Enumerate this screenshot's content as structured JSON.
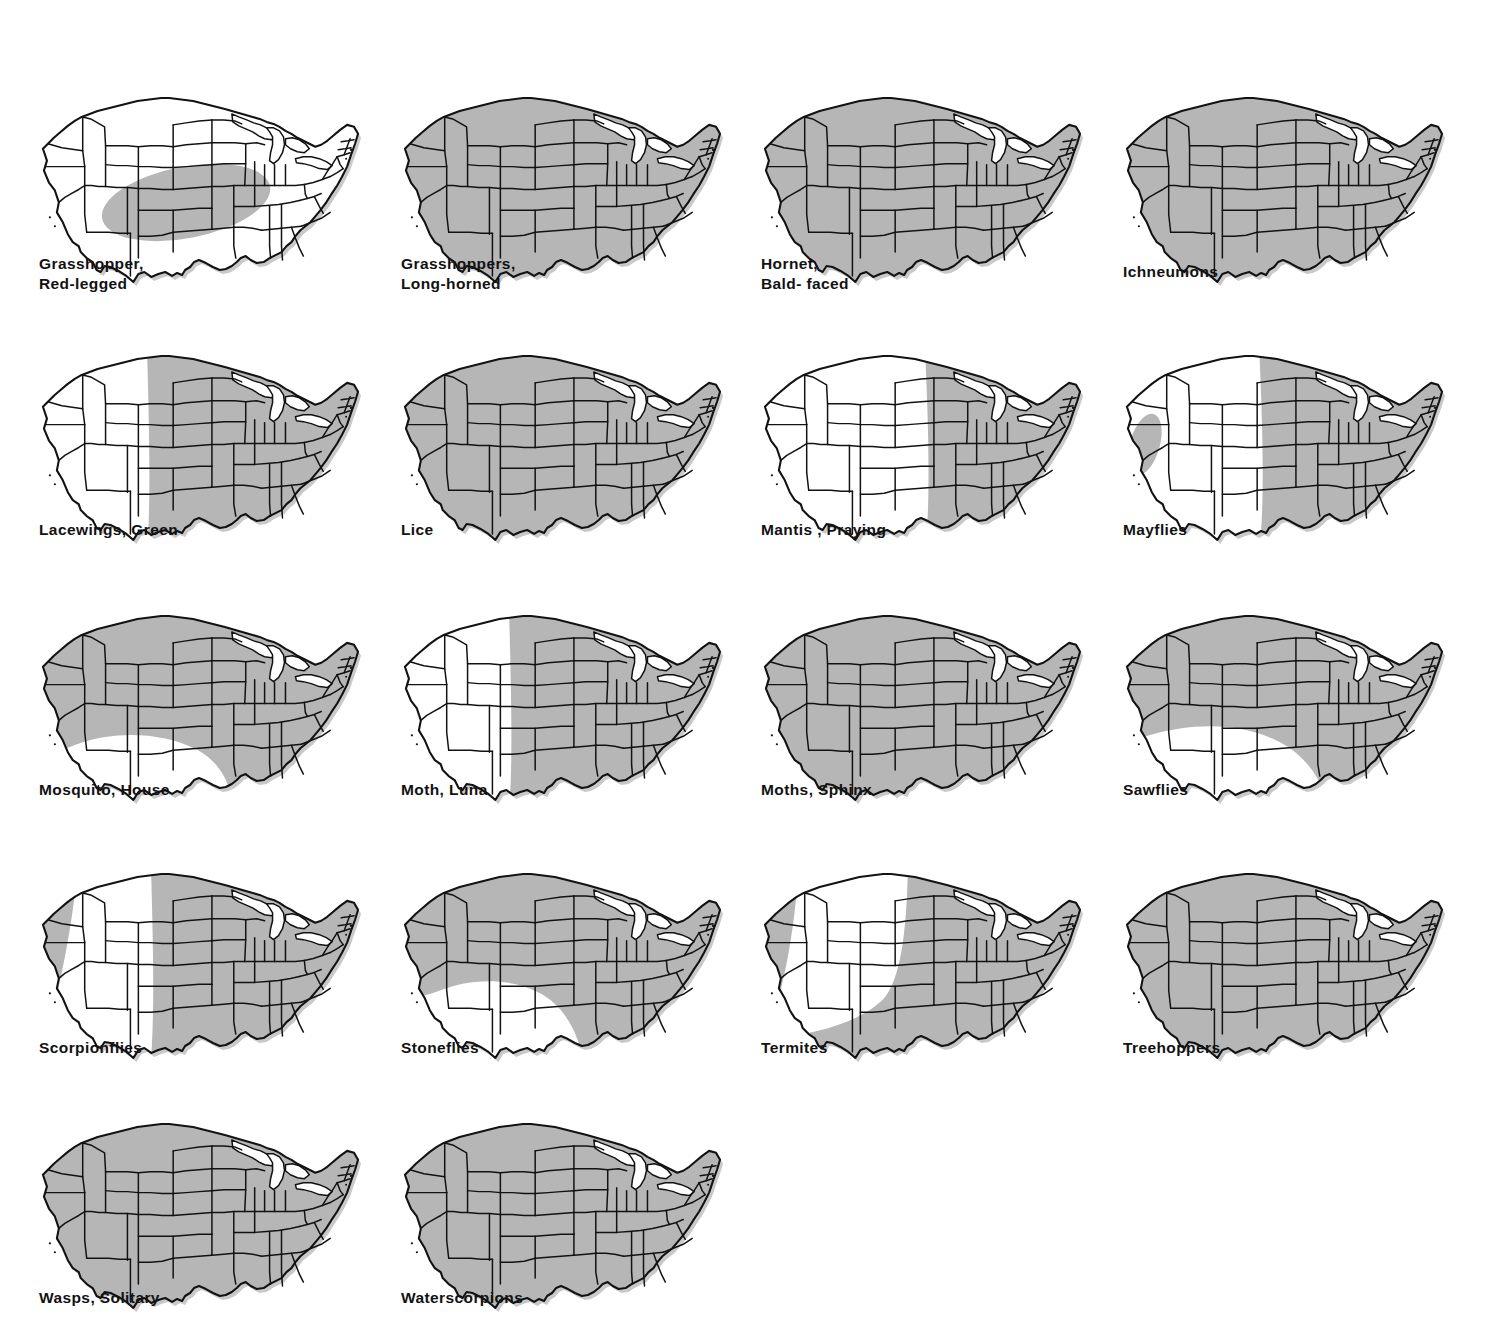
{
  "page": {
    "background_color": "#ffffff",
    "shade_color": "#b6b6b6",
    "ink_color": "#121212",
    "columns": 4,
    "rows": 5,
    "map_count": 18
  },
  "maps": [
    {
      "id": "grasshopper-red-legged",
      "label": "Grasshopper,\nRed-legged",
      "label_lines": [
        "Grasshopper,",
        "Red-legged"
      ],
      "range": "central-plains-blob",
      "row": 1,
      "col": 1
    },
    {
      "id": "grasshoppers-long-horned",
      "label": "Grasshoppers,\nLong-horned",
      "label_lines": [
        "Grasshoppers,",
        "Long-horned"
      ],
      "range": "entire",
      "row": 1,
      "col": 2
    },
    {
      "id": "hornet-bald-faced",
      "label": "Hornet,\nBald- faced",
      "label_lines": [
        "Hornet,",
        "Bald- faced"
      ],
      "range": "entire",
      "row": 1,
      "col": 3
    },
    {
      "id": "ichneumons",
      "label": "Ichneumons",
      "label_lines": [
        "Ichneumons"
      ],
      "range": "entire",
      "row": 1,
      "col": 4
    },
    {
      "id": "lacewings-green",
      "label": "Lacewings, Green",
      "label_lines": [
        "Lacewings, Green"
      ],
      "range": "east-of-rockies",
      "row": 2,
      "col": 1
    },
    {
      "id": "lice",
      "label": "Lice",
      "label_lines": [
        "Lice"
      ],
      "range": "entire",
      "row": 2,
      "col": 2
    },
    {
      "id": "mantis-praying",
      "label": "Mantis , Praying",
      "label_lines": [
        "Mantis , Praying"
      ],
      "range": "eastern-half",
      "row": 2,
      "col": 3
    },
    {
      "id": "mayflies",
      "label": "Mayflies",
      "label_lines": [
        "Mayflies"
      ],
      "range": "east-plus-california",
      "row": 2,
      "col": 4
    },
    {
      "id": "mosquito-house",
      "label": "Mosquito, House",
      "label_lines": [
        "Mosquito, House"
      ],
      "range": "all-but-southwest",
      "row": 3,
      "col": 1
    },
    {
      "id": "moth-luna",
      "label": "Moth, Luna",
      "label_lines": [
        "Moth, Luna"
      ],
      "range": "east-of-rockies",
      "row": 3,
      "col": 2
    },
    {
      "id": "moths-sphinx",
      "label": "Moths, Sphinx",
      "label_lines": [
        "Moths, Sphinx"
      ],
      "range": "entire",
      "row": 3,
      "col": 3
    },
    {
      "id": "sawflies",
      "label": "Sawflies",
      "label_lines": [
        "Sawflies"
      ],
      "range": "all-but-southwest-wide",
      "row": 3,
      "col": 4
    },
    {
      "id": "scorpionflies",
      "label": "Scorpionflies",
      "label_lines": [
        "Scorpionflies"
      ],
      "range": "east-plus-pacific-coast",
      "row": 4,
      "col": 1
    },
    {
      "id": "stoneflies",
      "label": "Stoneflies",
      "label_lines": [
        "Stoneflies"
      ],
      "range": "all-but-desert-southwest",
      "row": 4,
      "col": 2
    },
    {
      "id": "termites",
      "label": "Termites",
      "label_lines": [
        "Termites"
      ],
      "range": "east-plus-south-plus-pacific",
      "row": 4,
      "col": 3
    },
    {
      "id": "treehoppers",
      "label": "Treehoppers",
      "label_lines": [
        "Treehoppers"
      ],
      "range": "entire",
      "row": 4,
      "col": 4
    },
    {
      "id": "wasps-solitary",
      "label": "Wasps, Solitary",
      "label_lines": [
        "Wasps, Solitary"
      ],
      "range": "entire",
      "row": 5,
      "col": 1
    },
    {
      "id": "waterscorpions",
      "label": "Waterscorpions",
      "label_lines": [
        "Waterscorpions"
      ],
      "range": "entire",
      "row": 5,
      "col": 2
    }
  ],
  "layout": {
    "col_x": [
      35,
      397,
      757,
      1119
    ],
    "row_y": [
      84,
      342,
      602,
      860,
      1110
    ],
    "map_width": 330,
    "map_height": 205
  }
}
